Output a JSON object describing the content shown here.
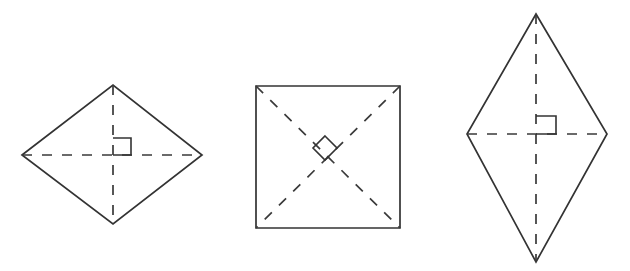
{
  "figure": {
    "type": "geometry-diagram",
    "title": "Quadrilaterals with perpendicular diagonals",
    "background_color": "#ffffff",
    "stroke_color": "#333333",
    "diagonal_stroke_color": "#3a3a3a",
    "width": 630,
    "height": 271,
    "shapes": [
      {
        "id": "shape-1",
        "name": "rhombus-wide",
        "label": "",
        "outline_points": "22,155 113,85 202,155 113,224",
        "diagonals": [
          {
            "name": "horizontal-diagonal",
            "d": "M 22 155 L 202 155"
          },
          {
            "name": "vertical-diagonal",
            "d": "M 113 85 L 113 224"
          }
        ],
        "angle_marker": {
          "name": "right-angle-square",
          "style": "axis-aligned-square",
          "d": "M 113 138 L 131 138 L 131 155 L 113 155"
        }
      },
      {
        "id": "shape-2",
        "name": "square",
        "label": "",
        "outline_points": "256,86 400,86 400,228 256,228",
        "diagonals": [
          {
            "name": "diagonal-tl-br",
            "d": "M 256 86 L 400 228"
          },
          {
            "name": "diagonal-tr-bl",
            "d": "M 400 86 L 256 228"
          }
        ],
        "angle_marker": {
          "name": "right-angle-square-rotated",
          "style": "rotated-diamond",
          "d": "M 325 136 L 337 148 L 325 160 L 313 148 Z"
        }
      },
      {
        "id": "shape-3",
        "name": "rhombus-tall",
        "label": "",
        "outline_points": "536,14 607,134 536,262 467,134",
        "diagonals": [
          {
            "name": "horizontal-diagonal",
            "d": "M 467 134 L 607 134"
          },
          {
            "name": "vertical-diagonal",
            "d": "M 536 14 L 536 262"
          }
        ],
        "angle_marker": {
          "name": "right-angle-square",
          "style": "axis-aligned-square",
          "d": "M 536 116 L 556 116 L 556 134 L 536 134"
        }
      }
    ]
  }
}
